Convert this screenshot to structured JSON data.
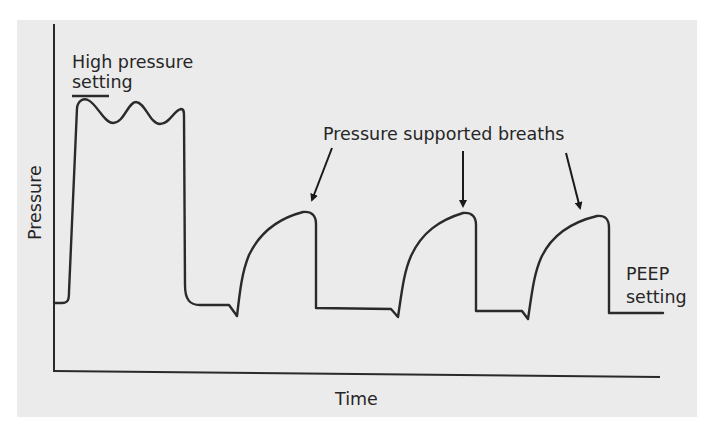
{
  "diagram": {
    "axes": {
      "y_label": "Pressure",
      "x_label": "Time"
    },
    "annotations": {
      "high_pressure_line1": "High pressure",
      "high_pressure_line2": "setting",
      "pressure_supported": "Pressure supported breaths",
      "peep_line1": "PEEP",
      "peep_line2": "setting"
    },
    "colors": {
      "panel_background": "#ebebeb",
      "stroke": "#2a2a2a",
      "text": "#262626"
    },
    "waveform": {
      "phases": [
        {
          "name": "baseline",
          "level": "PEEP"
        },
        {
          "name": "high pressure breath",
          "level": "High pressure setting",
          "oscillations": 3
        },
        {
          "name": "pressure supported breath 1"
        },
        {
          "name": "pressure supported breath 2"
        },
        {
          "name": "pressure supported breath 3"
        },
        {
          "name": "baseline",
          "level": "PEEP"
        }
      ]
    }
  }
}
